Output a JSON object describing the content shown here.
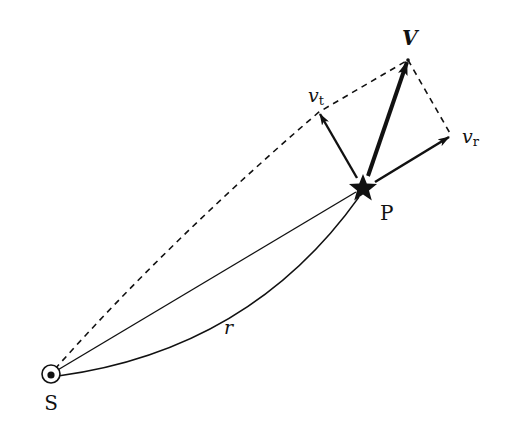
{
  "diagram": {
    "points": {
      "sun": {
        "label": "S",
        "x": 51,
        "y": 374
      },
      "star": {
        "label": "P",
        "x": 363,
        "y": 188
      }
    },
    "vectors": {
      "total_velocity": {
        "label": "V",
        "tip_x": 408,
        "tip_y": 60
      },
      "tangential_velocity": {
        "label": "v",
        "subscript": "t",
        "tip_x": 319,
        "tip_y": 112
      },
      "radial_velocity": {
        "label": "v",
        "subscript": "r",
        "tip_x": 451,
        "tip_y": 135
      }
    },
    "distance": {
      "label": "r"
    },
    "colors": {
      "ink": "#111111",
      "background": "#ffffff"
    }
  }
}
